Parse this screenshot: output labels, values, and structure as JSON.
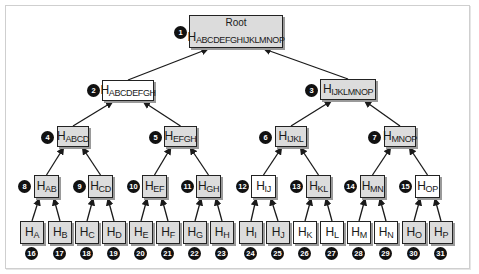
{
  "diagram": {
    "root": {
      "id": 1,
      "title": "Root",
      "label": "H",
      "sub": "ABCDEFGHIJKLMNOP",
      "fill": "gray"
    },
    "nodes": [
      {
        "id": 2,
        "label": "H",
        "sub": "ABCDEFGH",
        "fill": "white",
        "x": 102,
        "y": 80,
        "w": 52,
        "h": 21,
        "bx": 87,
        "by": 84
      },
      {
        "id": 3,
        "label": "H",
        "sub": "IJKLMNOP",
        "fill": "gray",
        "x": 320,
        "y": 79,
        "w": 56,
        "h": 21,
        "bx": 305,
        "by": 84
      },
      {
        "id": 4,
        "label": "H",
        "sub": "ABCD",
        "fill": "gray",
        "x": 57,
        "y": 126,
        "w": 32,
        "h": 21,
        "bx": 41,
        "by": 131
      },
      {
        "id": 5,
        "label": "H",
        "sub": "EFGH",
        "fill": "gray",
        "x": 164,
        "y": 126,
        "w": 33,
        "h": 21,
        "bx": 149,
        "by": 131
      },
      {
        "id": 6,
        "label": "H",
        "sub": "IJKL",
        "fill": "gray",
        "x": 275,
        "y": 126,
        "w": 32,
        "h": 21,
        "bx": 259,
        "by": 131
      },
      {
        "id": 7,
        "label": "H",
        "sub": "MNOP",
        "fill": "gray",
        "x": 384,
        "y": 126,
        "w": 32,
        "h": 21,
        "bx": 368,
        "by": 131
      },
      {
        "id": 8,
        "label": "H",
        "sub": "AB",
        "fill": "gray",
        "x": 34,
        "y": 175,
        "w": 25,
        "h": 23,
        "bx": 18,
        "by": 180
      },
      {
        "id": 9,
        "label": "H",
        "sub": "CD",
        "fill": "gray",
        "x": 88,
        "y": 175,
        "w": 25,
        "h": 23,
        "bx": 73,
        "by": 180
      },
      {
        "id": 10,
        "label": "H",
        "sub": "EF",
        "fill": "gray",
        "x": 142,
        "y": 175,
        "w": 25,
        "h": 23,
        "bx": 127,
        "by": 180
      },
      {
        "id": 11,
        "label": "H",
        "sub": "GH",
        "fill": "gray",
        "x": 196,
        "y": 175,
        "w": 25,
        "h": 23,
        "bx": 181,
        "by": 180
      },
      {
        "id": 12,
        "label": "H",
        "sub": "IJ",
        "fill": "white",
        "x": 251,
        "y": 175,
        "w": 25,
        "h": 23,
        "bx": 236,
        "by": 180
      },
      {
        "id": 13,
        "label": "H",
        "sub": "KL",
        "fill": "gray",
        "x": 306,
        "y": 175,
        "w": 25,
        "h": 23,
        "bx": 290,
        "by": 180
      },
      {
        "id": 14,
        "label": "H",
        "sub": "MN",
        "fill": "gray",
        "x": 360,
        "y": 175,
        "w": 25,
        "h": 23,
        "bx": 344,
        "by": 180
      },
      {
        "id": 15,
        "label": "H",
        "sub": "OP",
        "fill": "white",
        "x": 415,
        "y": 175,
        "w": 25,
        "h": 23,
        "bx": 399,
        "by": 180
      }
    ],
    "leaves": [
      {
        "id": 16,
        "label": "H",
        "sub": "A",
        "fill": "gray",
        "x": 20
      },
      {
        "id": 17,
        "label": "H",
        "sub": "B",
        "fill": "gray",
        "x": 48
      },
      {
        "id": 18,
        "label": "H",
        "sub": "C",
        "fill": "gray",
        "x": 75
      },
      {
        "id": 19,
        "label": "H",
        "sub": "D",
        "fill": "gray",
        "x": 102
      },
      {
        "id": 20,
        "label": "H",
        "sub": "E",
        "fill": "gray",
        "x": 129
      },
      {
        "id": 21,
        "label": "H",
        "sub": "F",
        "fill": "gray",
        "x": 156
      },
      {
        "id": 22,
        "label": "H",
        "sub": "G",
        "fill": "gray",
        "x": 183
      },
      {
        "id": 23,
        "label": "H",
        "sub": "H",
        "fill": "gray",
        "x": 210
      },
      {
        "id": 24,
        "label": "H",
        "sub": "I",
        "fill": "gray",
        "x": 239
      },
      {
        "id": 25,
        "label": "H",
        "sub": "J",
        "fill": "gray",
        "x": 266
      },
      {
        "id": 26,
        "label": "H",
        "sub": "K",
        "fill": "white",
        "x": 293
      },
      {
        "id": 27,
        "label": "H",
        "sub": "L",
        "fill": "white",
        "x": 320
      },
      {
        "id": 28,
        "label": "H",
        "sub": "M",
        "fill": "white",
        "x": 347
      },
      {
        "id": 29,
        "label": "H",
        "sub": "N",
        "fill": "white",
        "x": 374
      },
      {
        "id": 30,
        "label": "H",
        "sub": "O",
        "fill": "gray",
        "x": 402
      },
      {
        "id": 31,
        "label": "H",
        "sub": "P",
        "fill": "gray",
        "x": 429
      }
    ],
    "colors": {
      "gray_fill": "#dcdcdc",
      "white_fill": "#ffffff",
      "border": "#222222",
      "badge": "#111111",
      "edge": "#1a1a1a"
    }
  }
}
